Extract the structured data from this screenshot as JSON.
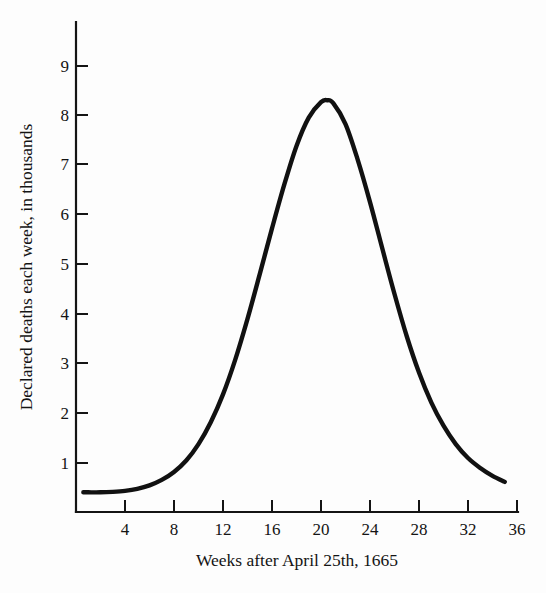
{
  "chart_data": {
    "type": "line",
    "title": "",
    "subtitle": "",
    "xlabel": "Weeks after April 25th, 1665",
    "ylabel": "Declared deaths each week, in thousands",
    "xlim": [
      0,
      36
    ],
    "ylim": [
      0,
      9.6
    ],
    "grid": false,
    "legend": "none",
    "xticks": [
      4,
      8,
      12,
      16,
      20,
      24,
      28,
      32,
      36
    ],
    "xtick_labels": [
      "4",
      "8",
      "12",
      "16",
      "20",
      "24",
      "28",
      "32",
      "36"
    ],
    "yticks": [
      1,
      2,
      3,
      4,
      5,
      6,
      7,
      8,
      9
    ],
    "ytick_labels": [
      "1",
      "2",
      "3",
      "4",
      "5",
      "6",
      "7",
      "8",
      "9"
    ],
    "series": [
      {
        "name": "Declared deaths each week",
        "color": "#111111",
        "x": [
          0.6,
          1,
          2,
          3,
          4,
          5,
          6,
          7,
          8,
          9,
          10,
          11,
          12,
          13,
          14,
          15,
          16,
          17,
          18,
          19,
          20,
          20.5,
          21,
          22,
          23,
          24,
          25,
          26,
          27,
          28,
          29,
          30,
          31,
          32,
          33,
          34,
          35
        ],
        "values": [
          0.41,
          0.41,
          0.41,
          0.42,
          0.44,
          0.48,
          0.55,
          0.66,
          0.82,
          1.05,
          1.38,
          1.82,
          2.38,
          3.08,
          3.9,
          4.8,
          5.72,
          6.6,
          7.38,
          7.95,
          8.26,
          8.3,
          8.24,
          7.82,
          7.1,
          6.25,
          5.32,
          4.4,
          3.55,
          2.82,
          2.22,
          1.75,
          1.38,
          1.1,
          0.9,
          0.74,
          0.62
        ]
      }
    ],
    "annotations": {
      "peak_week": 20.5,
      "peak_value": 8.3,
      "baseline_value": 0.41,
      "final_value": 0.62
    }
  },
  "axes": {
    "y_axis_title": "Declared deaths each week, in thousands",
    "x_axis_title": "Weeks after April 25th, 1665"
  }
}
